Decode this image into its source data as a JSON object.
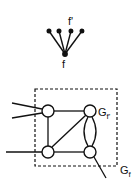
{
  "diagram": {
    "colors": {
      "stroke": "#111111",
      "background": "#ffffff"
    },
    "fan": {
      "top_label": "f'",
      "bottom_label": "f",
      "apex": [
        65,
        54
      ],
      "leaves": [
        [
          49,
          31
        ],
        [
          59,
          31
        ],
        [
          71,
          31
        ],
        [
          82,
          31
        ]
      ]
    },
    "graph": {
      "inner_label": "G",
      "inner_label_sub": "f'",
      "outer_label": "G",
      "outer_label_sub": "f",
      "box": {
        "x": 35,
        "y": 89,
        "w": 82,
        "h": 77
      },
      "nodes": [
        {
          "id": "tl",
          "x": 48,
          "y": 111
        },
        {
          "id": "tr",
          "x": 90,
          "y": 111
        },
        {
          "id": "bl",
          "x": 48,
          "y": 152
        },
        {
          "id": "br",
          "x": 90,
          "y": 152
        }
      ]
    }
  }
}
